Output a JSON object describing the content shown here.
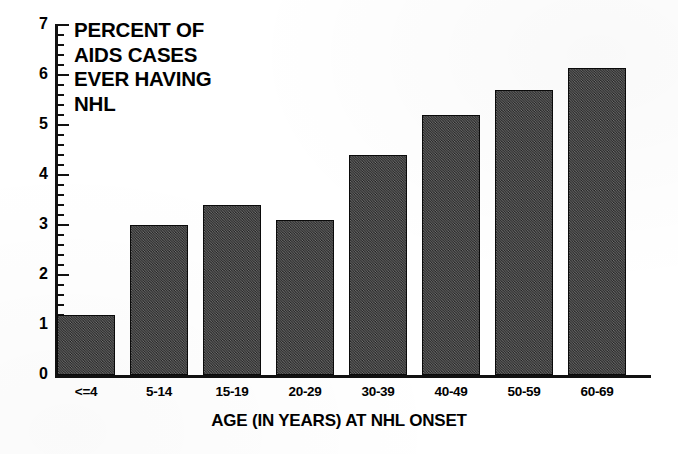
{
  "chart_data": {
    "type": "bar",
    "title": "PERCENT OF\nAIDS CASES\nEVER HAVING\nNHL",
    "title_lines": [
      "PERCENT OF",
      "AIDS CASES",
      "EVER HAVING",
      "NHL"
    ],
    "xlabel": "AGE (IN YEARS) AT NHL ONSET",
    "ylabel": "",
    "categories": [
      "<=4",
      "5-14",
      "15-19",
      "20-29",
      "30-39",
      "40-49",
      "50-59",
      "60-69"
    ],
    "values": [
      1.2,
      3.0,
      3.4,
      3.1,
      4.4,
      5.2,
      5.7,
      6.15
    ],
    "ylim": [
      0,
      7
    ],
    "ytick_labels": [
      "0",
      "1",
      "2",
      "3",
      "4",
      "5",
      "6",
      "7"
    ],
    "ytick_values": [
      0,
      1,
      2,
      3,
      4,
      5,
      6,
      7
    ],
    "minor_tick_interval": 0.2,
    "grid": false,
    "legend": null,
    "bar_color": "#3b3b3b",
    "bar_edge_color": "#0a0a0a",
    "background_color": "#ffffff",
    "axis_color": "#111111"
  }
}
